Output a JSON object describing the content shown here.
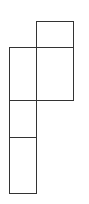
{
  "diagram": {
    "type": "rectangle-layout",
    "stroke_color": "#333333",
    "background": "#ffffff",
    "rectangles": [
      {
        "id": "top-right-small",
        "x": 36,
        "y": 21,
        "w": 38,
        "h": 26
      },
      {
        "id": "right-large",
        "x": 36,
        "y": 47,
        "w": 38,
        "h": 54
      },
      {
        "id": "left-upper",
        "x": 9,
        "y": 47,
        "w": 28,
        "h": 54
      },
      {
        "id": "left-middle",
        "x": 9,
        "y": 100,
        "w": 28,
        "h": 38
      },
      {
        "id": "left-bottom",
        "x": 9,
        "y": 137,
        "w": 28,
        "h": 57
      }
    ]
  }
}
